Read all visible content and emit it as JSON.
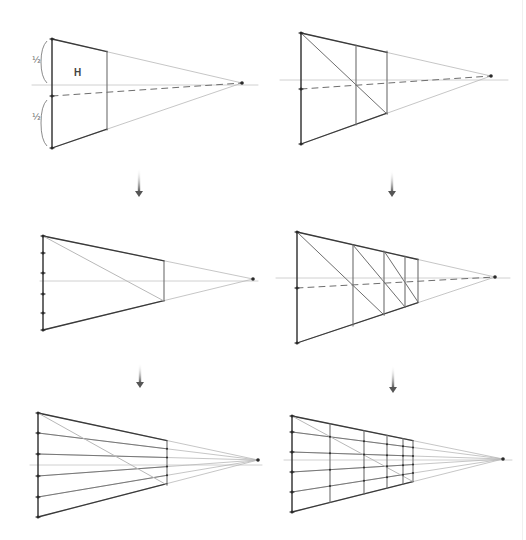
{
  "figure": {
    "title": "",
    "width": 526,
    "height": 540,
    "colors": {
      "background": "#ffffff",
      "strong_line": "#3a3a3a",
      "medium_line": "#6e6e6e",
      "faint_line": "#b8b8b8",
      "horizon": "#c4c4c4",
      "dot": "#2a2a2a",
      "arrow": "#555555"
    }
  },
  "panels": [
    {
      "id": "step-1",
      "vp": [
        242,
        83
      ],
      "horizon": {
        "x1": 32,
        "x2": 258,
        "y": 85
      },
      "front_edge": {
        "x": 52,
        "top": 39,
        "bottom": 148
      },
      "back_edges": [
        {
          "x": 107,
          "top": 51,
          "bottom": 130
        }
      ],
      "dashed_center": {
        "from": [
          52,
          96
        ],
        "to": [
          242,
          83
        ]
      },
      "diagonals": [],
      "ticks": [
        39,
        96,
        148
      ],
      "guide_lines_y": [],
      "labels": [
        {
          "text": "½",
          "x": 32,
          "y": 63,
          "kind": "frac"
        },
        {
          "text": "½",
          "x": 32,
          "y": 120,
          "kind": "frac"
        },
        {
          "text": "H",
          "x": 74,
          "y": 76,
          "kind": "h"
        }
      ],
      "braces": [
        {
          "x": 47,
          "top": 41,
          "bottom": 83
        },
        {
          "x": 47,
          "top": 100,
          "bottom": 146
        }
      ]
    },
    {
      "id": "step-2",
      "vp": [
        491,
        76
      ],
      "horizon": {
        "x1": 280,
        "x2": 508,
        "y": 80
      },
      "front_edge": {
        "x": 301,
        "top": 33,
        "bottom": 144
      },
      "back_edges": [
        {
          "x": 356,
          "top": 45,
          "bottom": 125
        },
        {
          "x": 387,
          "top": 51,
          "bottom": 114
        }
      ],
      "dashed_center": {
        "from": [
          301,
          89
        ],
        "to": [
          491,
          76
        ]
      },
      "diagonals": [
        {
          "from": [
            301,
            33
          ],
          "to": [
            387,
            114
          ]
        }
      ],
      "ticks": [
        33,
        89,
        144
      ],
      "guide_lines_y": [],
      "labels": [],
      "braces": []
    },
    {
      "id": "step-3",
      "vp": [
        253,
        279
      ],
      "horizon": {
        "x1": 40,
        "x2": 258,
        "y": 281
      },
      "front_edge": {
        "x": 43,
        "top": 236,
        "bottom": 330
      },
      "back_edges": [
        {
          "x": 164,
          "top": 261,
          "bottom": 301
        }
      ],
      "dashed_center": null,
      "diagonals": [
        {
          "from": [
            43,
            236
          ],
          "to": [
            164,
            301
          ]
        }
      ],
      "ticks": [
        236,
        253,
        273,
        294,
        313,
        330
      ],
      "guide_lines_y": [],
      "labels": [],
      "braces": []
    },
    {
      "id": "step-4",
      "vp": [
        495,
        277
      ],
      "horizon": {
        "x1": 276,
        "x2": 510,
        "y": 278
      },
      "front_edge": {
        "x": 297,
        "top": 232,
        "bottom": 343
      },
      "back_edges": [
        {
          "x": 353,
          "top": 245,
          "bottom": 326
        },
        {
          "x": 384,
          "top": 251,
          "bottom": 315
        },
        {
          "x": 405,
          "top": 256,
          "bottom": 307
        },
        {
          "x": 418,
          "top": 259,
          "bottom": 302
        }
      ],
      "dashed_center": {
        "from": [
          297,
          288
        ],
        "to": [
          495,
          277
        ]
      },
      "diagonals": [
        {
          "from": [
            297,
            232
          ],
          "to": [
            384,
            315
          ]
        },
        {
          "from": [
            353,
            245
          ],
          "to": [
            405,
            307
          ]
        },
        {
          "from": [
            384,
            251
          ],
          "to": [
            418,
            302
          ]
        }
      ],
      "ticks": [
        232,
        288,
        343
      ],
      "guide_lines_y": [],
      "labels": [],
      "braces": []
    },
    {
      "id": "step-5",
      "vp": [
        258,
        460
      ],
      "horizon": {
        "x1": 30,
        "x2": 262,
        "y": 465
      },
      "front_edge": {
        "x": 38,
        "top": 413,
        "bottom": 517
      },
      "back_edges": [
        {
          "x": 167,
          "top": 441,
          "bottom": 485
        }
      ],
      "dashed_center": null,
      "diagonals": [
        {
          "from": [
            38,
            413
          ],
          "to": [
            167,
            485
          ]
        }
      ],
      "ticks": [
        413,
        433,
        454,
        476,
        497,
        517
      ],
      "guide_lines_y": [
        433,
        454,
        476,
        497
      ],
      "labels": [],
      "braces": []
    },
    {
      "id": "step-6",
      "vp": [
        503,
        459
      ],
      "horizon": {
        "x1": 284,
        "x2": 512,
        "y": 460
      },
      "front_edge": {
        "x": 292,
        "top": 416,
        "bottom": 512
      },
      "back_edges": [
        {
          "x": 330,
          "top": 0,
          "bottom": 0
        },
        {
          "x": 364,
          "top": 0,
          "bottom": 0
        },
        {
          "x": 387,
          "top": 0,
          "bottom": 0
        },
        {
          "x": 403,
          "top": 0,
          "bottom": 0
        },
        {
          "x": 413,
          "top": 0,
          "bottom": 0
        }
      ],
      "dashed_center": null,
      "diagonals": [
        {
          "from": [
            292,
            416
          ],
          "to": [
            413,
            0
          ]
        }
      ],
      "ticks": [
        416,
        432,
        452,
        472,
        492,
        512
      ],
      "guide_lines_y": [
        432,
        452,
        472,
        492
      ],
      "labels": [],
      "braces": []
    }
  ],
  "arrows": [
    {
      "x": 139,
      "y1": 168,
      "y2": 197
    },
    {
      "x": 392,
      "y1": 170,
      "y2": 197
    },
    {
      "x": 140,
      "y1": 363,
      "y2": 388
    },
    {
      "x": 393,
      "y1": 365,
      "y2": 393
    }
  ]
}
